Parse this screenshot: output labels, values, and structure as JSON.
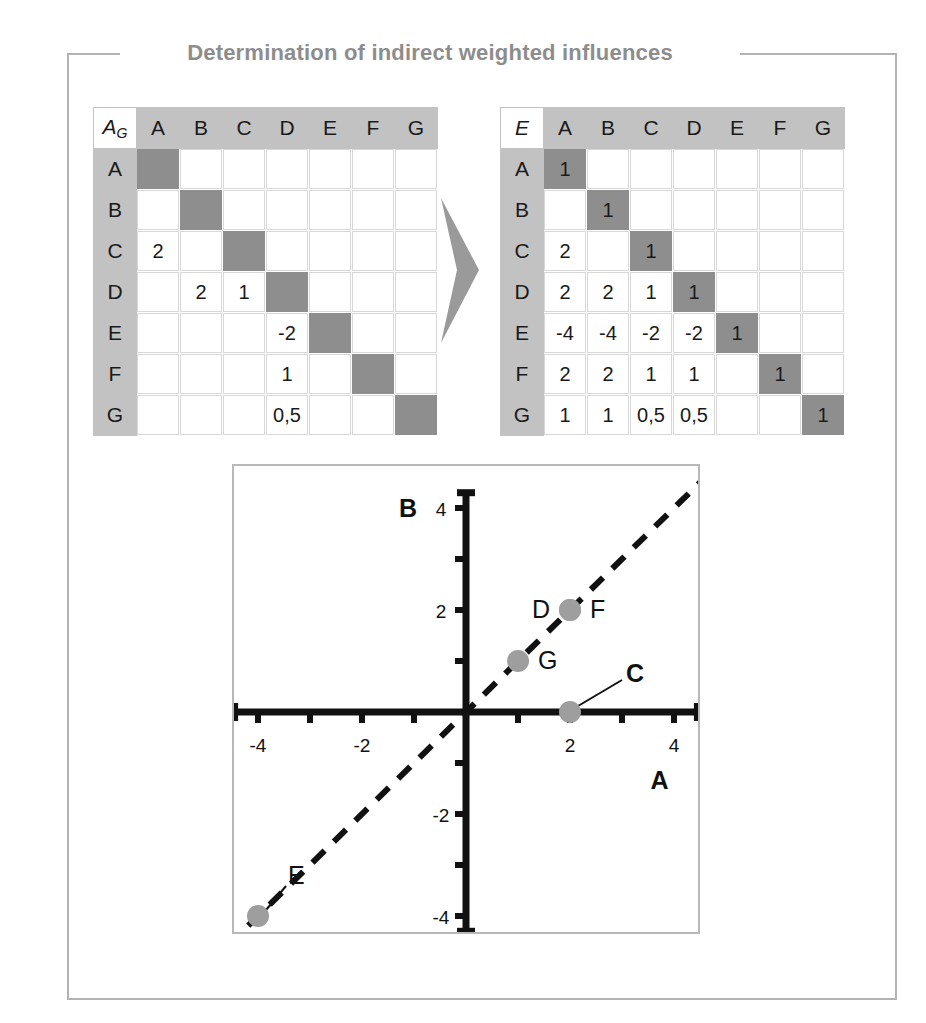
{
  "figure": {
    "title": "Determination of indirect weighted influences",
    "title_color": "#8d8d8d",
    "frame_color": "#b3b3b3"
  },
  "matrix_left": {
    "name": "direct-influence-matrix",
    "corner_label": "A",
    "corner_sub": "G",
    "columns": [
      "A",
      "B",
      "C",
      "D",
      "E",
      "F",
      "G"
    ],
    "rows": [
      "A",
      "B",
      "C",
      "D",
      "E",
      "F",
      "G"
    ],
    "cells": [
      [
        "",
        "",
        "",
        "",
        "",
        "",
        ""
      ],
      [
        "",
        "",
        "",
        "",
        "",
        "",
        ""
      ],
      [
        "2",
        "",
        "",
        "",
        "",
        "",
        ""
      ],
      [
        "",
        "2",
        "1",
        "",
        "",
        "",
        ""
      ],
      [
        "",
        "",
        "",
        "-2",
        "",
        "",
        ""
      ],
      [
        "",
        "",
        "",
        "1",
        "",
        "",
        ""
      ],
      [
        "",
        "",
        "",
        "0,5",
        "",
        "",
        ""
      ]
    ],
    "diagonal_fill": "#8e8e8e",
    "header_fill": "#c2c2c2"
  },
  "matrix_right": {
    "name": "indirect-influence-matrix",
    "corner_label": "E",
    "columns": [
      "A",
      "B",
      "C",
      "D",
      "E",
      "F",
      "G"
    ],
    "rows": [
      "A",
      "B",
      "C",
      "D",
      "E",
      "F",
      "G"
    ],
    "cells": [
      [
        "1",
        "",
        "",
        "",
        "",
        "",
        ""
      ],
      [
        "",
        "1",
        "",
        "",
        "",
        "",
        ""
      ],
      [
        "2",
        "",
        "1",
        "",
        "",
        "",
        ""
      ],
      [
        "2",
        "2",
        "1",
        "1",
        "",
        "",
        ""
      ],
      [
        "-4",
        "-4",
        "-2",
        "-2",
        "1",
        "",
        ""
      ],
      [
        "2",
        "2",
        "1",
        "1",
        "",
        "1",
        ""
      ],
      [
        "1",
        "1",
        "0,5",
        "0,5",
        "",
        "",
        "1"
      ]
    ],
    "diagonal_fill": "#8e8e8e",
    "header_fill": "#c2c2c2"
  },
  "arrow": {
    "name": "transform-arrow",
    "color": "#9a9a9a"
  },
  "chart_data": {
    "type": "scatter",
    "title": "",
    "xlabel": "A",
    "ylabel": "B",
    "xlim": [
      -4.6,
      4.6
    ],
    "ylim": [
      -4.6,
      4.6
    ],
    "grid": false,
    "legend": "none",
    "xticks": [
      -4,
      -3,
      -2,
      -1,
      1,
      2,
      3,
      4
    ],
    "yticks": [
      -4,
      -3,
      -2,
      -1,
      1,
      2,
      3,
      4
    ],
    "xtick_labels": [
      {
        "value": -4,
        "text": "-4"
      },
      {
        "value": -2,
        "text": "-2"
      },
      {
        "value": 2,
        "text": "2"
      },
      {
        "value": 4,
        "text": "4"
      }
    ],
    "ytick_labels": [
      {
        "value": 4,
        "text": "4"
      },
      {
        "value": 2,
        "text": "2"
      },
      {
        "value": -2,
        "text": "-2"
      },
      {
        "value": -4,
        "text": "-4"
      }
    ],
    "reference_line": {
      "name": "diagonal-reference-line",
      "style": "dashed",
      "from": [
        -4.6,
        -4.6
      ],
      "to": [
        4.6,
        4.6
      ]
    },
    "point_color": "#9e9e9e",
    "points": [
      {
        "label": "D",
        "x": 2,
        "y": 2,
        "label_side": "left",
        "bold": false,
        "leader": false
      },
      {
        "label": "F",
        "x": 2,
        "y": 2,
        "label_side": "right",
        "bold": false,
        "leader": false
      },
      {
        "label": "G",
        "x": 1,
        "y": 1,
        "label_side": "right",
        "bold": false,
        "leader": false
      },
      {
        "label": "C",
        "x": 2,
        "y": 0,
        "label_side": "upper-right",
        "bold": true,
        "leader": true
      },
      {
        "label": "E",
        "x": -4,
        "y": -4,
        "label_side": "upper-right",
        "bold": false,
        "leader": true
      }
    ]
  }
}
